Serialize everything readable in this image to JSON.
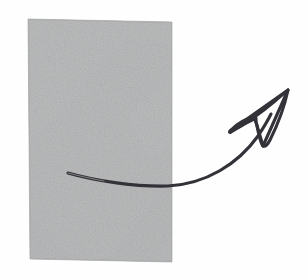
{
  "canvas": {
    "width": 308,
    "height": 278,
    "background_color": "#fefefe",
    "description": "Hand-drawn style illustration: a gray rectangular sheet of paper with a curved arrow sweeping across it toward the upper right"
  },
  "paper": {
    "name": "gray paper sheet",
    "base_color": "#b4b5b6",
    "edge_color": "#a8a9aa",
    "shadow_band_color": "#a9aaab",
    "highlight_band_color": "#c2c3c4",
    "texture": "grainy speckled paper",
    "corners": {
      "top_left": [
        28,
        19
      ],
      "top_right": [
        172,
        22
      ],
      "bottom_right": [
        172,
        262
      ],
      "bottom_left": [
        30,
        259
      ]
    }
  },
  "arrow": {
    "name": "curved arrow",
    "stroke_color": "#333338",
    "stroke_width": 3.1,
    "fill": "none",
    "style": "hand-drawn outlined arrowhead",
    "tail_start": [
      68,
      173
    ],
    "curve_low_point": [
      170,
      186
    ],
    "tip": [
      288,
      90
    ],
    "left_barb": [
      256,
      118
    ],
    "direction": "left to upper-right"
  },
  "chart_data": {
    "type": "diagram",
    "title": "",
    "elements": [
      {
        "label": "paper sheet",
        "shape": "quadrilateral",
        "color": "#b4b5b6"
      },
      {
        "label": "curved arrow",
        "shape": "path",
        "color": "#333338"
      }
    ]
  }
}
